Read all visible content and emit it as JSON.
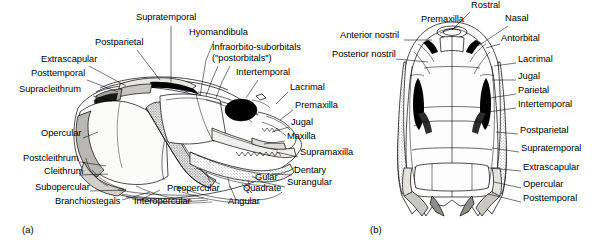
{
  "figure": {
    "panels": [
      {
        "id": "a",
        "letter": "(a)",
        "caption": "lateral view of fish skull"
      },
      {
        "id": "b",
        "letter": "(b)",
        "caption": "dorsal view of fish skull"
      }
    ]
  },
  "panel_a": {
    "letter": "(a)",
    "labels": [
      {
        "text": "Supratemporal",
        "x": 136,
        "y": 18,
        "align": "left"
      },
      {
        "text": "Hyomandibula",
        "x": 189,
        "y": 33,
        "align": "left"
      },
      {
        "text": "Infraorbito-suborbitals",
        "x": 212,
        "y": 48,
        "align": "left"
      },
      {
        "text": "(\"postorbitals\")",
        "x": 212,
        "y": 59,
        "align": "left"
      },
      {
        "text": "Postparietal",
        "x": 95,
        "y": 43,
        "align": "left"
      },
      {
        "text": "Extrascapular",
        "x": 41,
        "y": 60,
        "align": "left"
      },
      {
        "text": "Posttemporal",
        "x": 31,
        "y": 74,
        "align": "left"
      },
      {
        "text": "Supracleithrum",
        "x": 19,
        "y": 90,
        "align": "left"
      },
      {
        "text": "Intertemporal",
        "x": 236,
        "y": 73,
        "align": "left"
      },
      {
        "text": "Lacrimal",
        "x": 290,
        "y": 88,
        "align": "left"
      },
      {
        "text": "Premaxilla",
        "x": 295,
        "y": 106,
        "align": "left"
      },
      {
        "text": "Jugal",
        "x": 291,
        "y": 123,
        "align": "left"
      },
      {
        "text": "Maxilla",
        "x": 287,
        "y": 137,
        "align": "left"
      },
      {
        "text": "Supramaxilla",
        "x": 300,
        "y": 153,
        "align": "left"
      },
      {
        "text": "Dentary",
        "x": 294,
        "y": 171,
        "align": "left"
      },
      {
        "text": "Surangular",
        "x": 287,
        "y": 183,
        "align": "left"
      },
      {
        "text": "Opercular",
        "x": 41,
        "y": 134,
        "align": "left"
      },
      {
        "text": "Postcleithrum",
        "x": 23,
        "y": 159,
        "align": "left"
      },
      {
        "text": "Cleithrum",
        "x": 44,
        "y": 172,
        "align": "left"
      },
      {
        "text": "Subopercular",
        "x": 35,
        "y": 188,
        "align": "left"
      },
      {
        "text": "Branchiostegals",
        "x": 55,
        "y": 202,
        "align": "left"
      },
      {
        "text": "Interopercular",
        "x": 134,
        "y": 202,
        "align": "left"
      },
      {
        "text": "Preopercular",
        "x": 167,
        "y": 189,
        "align": "left"
      },
      {
        "text": "Angular",
        "x": 228,
        "y": 202,
        "align": "left"
      },
      {
        "text": "Quadrate",
        "x": 243,
        "y": 189,
        "align": "left"
      },
      {
        "text": "Gular",
        "x": 255,
        "y": 178,
        "align": "left"
      }
    ]
  },
  "panel_b": {
    "letter": "(b)",
    "labels": [
      {
        "text": "Rostral",
        "x": 471,
        "y": 4,
        "align": "left"
      },
      {
        "text": "Premaxilla",
        "x": 421,
        "y": 19,
        "align": "left"
      },
      {
        "text": "Nasal",
        "x": 505,
        "y": 18,
        "align": "left"
      },
      {
        "text": "Anterior nostril",
        "x": 340,
        "y": 35,
        "align": "left"
      },
      {
        "text": "Antorbital",
        "x": 501,
        "y": 38,
        "align": "left"
      },
      {
        "text": "Posterior nostril",
        "x": 332,
        "y": 54,
        "align": "left"
      },
      {
        "text": "Lacrimal",
        "x": 518,
        "y": 59,
        "align": "left"
      },
      {
        "text": "Jugal",
        "x": 518,
        "y": 76,
        "align": "left"
      },
      {
        "text": "Parietal",
        "x": 518,
        "y": 90,
        "align": "left"
      },
      {
        "text": "Intertemporal",
        "x": 518,
        "y": 104,
        "align": "left"
      },
      {
        "text": "Postparietal",
        "x": 520,
        "y": 130,
        "align": "left"
      },
      {
        "text": "Supratemporal",
        "x": 521,
        "y": 148,
        "align": "left"
      },
      {
        "text": "Extrascapular",
        "x": 523,
        "y": 167,
        "align": "left"
      },
      {
        "text": "Opercular",
        "x": 523,
        "y": 184,
        "align": "left"
      },
      {
        "text": "Posttemporal",
        "x": 523,
        "y": 198,
        "align": "left"
      }
    ]
  },
  "colors": {
    "background": "#ffffff",
    "ink": "#000000",
    "bone_light": "#fdfdfd",
    "bone_shade": "#d8d6d2",
    "bone_mid": "#bfbdb8",
    "bone_dark": "#8e8c88",
    "orbit_black": "#000000"
  }
}
